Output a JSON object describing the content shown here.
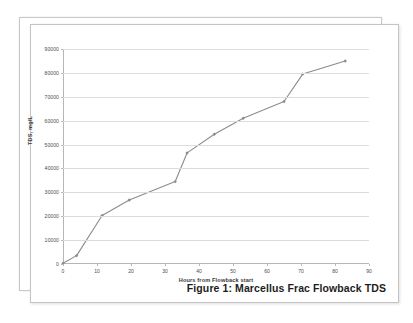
{
  "document": {
    "caption": "Figure 1: Marcellus Frac Flowback TDS"
  },
  "chart_data": {
    "type": "line",
    "title": "",
    "xlabel": "Hours from Flowback start",
    "ylabel": "TDS, mg/L",
    "xlim": [
      0,
      90
    ],
    "ylim": [
      0,
      90000
    ],
    "grid": true,
    "legend": "none",
    "line_color": "#8c8c8c",
    "marker": "diamond",
    "xticks": [
      0,
      10,
      20,
      30,
      40,
      50,
      60,
      70,
      80,
      90
    ],
    "xtick_labels": [
      "0",
      "10",
      "20",
      "30",
      "40",
      "50",
      "60",
      "70",
      "80",
      "90"
    ],
    "yticks": [
      0,
      10000,
      20000,
      30000,
      40000,
      50000,
      60000,
      70000,
      80000,
      90000
    ],
    "ytick_labels": [
      "0",
      "10000",
      "20000",
      "30000",
      "40000",
      "50000",
      "60000",
      "70000",
      "80000",
      "90000"
    ],
    "series": [
      {
        "name": "TDS",
        "x": [
          0,
          4,
          11.5,
          19.5,
          33,
          36.5,
          44.5,
          53,
          65,
          70.5,
          83
        ],
        "values": [
          300,
          3500,
          20300,
          26800,
          34500,
          46500,
          54300,
          61000,
          68000,
          79500,
          85000
        ]
      }
    ]
  }
}
